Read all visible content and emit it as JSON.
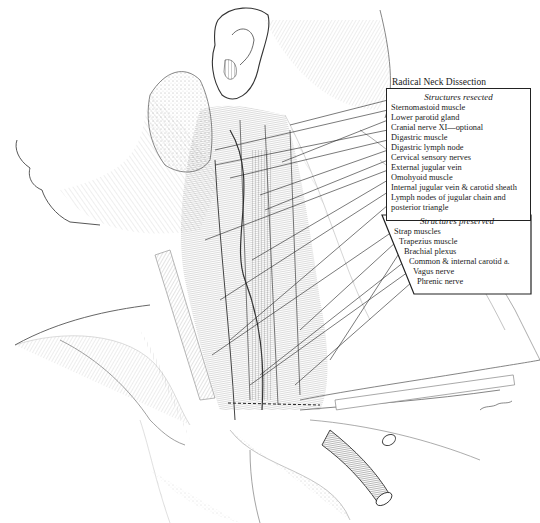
{
  "title": "Radical Neck Dissection",
  "resected": {
    "heading": "Structures resected",
    "items": [
      {
        "label": "Sternomastoid muscle"
      },
      {
        "label": "Lower parotid gland"
      },
      {
        "label": "Cranial nerve XI—optional"
      },
      {
        "label": "Digastric muscle"
      },
      {
        "label": "Digastric lymph node"
      },
      {
        "label": "Cervical sensory nerves"
      },
      {
        "label": "External jugular vein"
      },
      {
        "label": "Omohyoid muscle"
      },
      {
        "label": "Internal jugular vein & carotid sheath"
      },
      {
        "label": "Lymph nodes of jugular chain and"
      },
      {
        "label": "posterior triangle"
      }
    ]
  },
  "preserved": {
    "heading": "Structures preserved",
    "items": [
      {
        "label": "Strap muscles"
      },
      {
        "label": "Trapezius muscle"
      },
      {
        "label": "Brachial plexus"
      },
      {
        "label": "Common & internal carotid a."
      },
      {
        "label": "Vagus nerve"
      },
      {
        "label": "Phrenic nerve"
      }
    ]
  },
  "illustration": {
    "subject": "lateral view of neck dissection",
    "style": "pen-and-ink hatching",
    "ink_color": "#2a2a2a"
  },
  "signature": "artist signature"
}
